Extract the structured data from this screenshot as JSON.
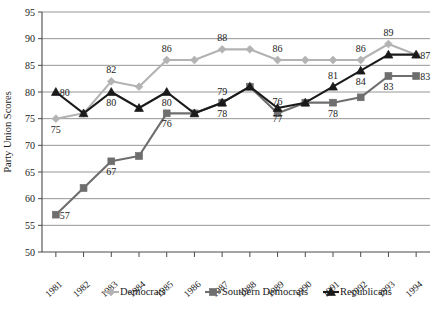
{
  "chart_data": {
    "type": "line",
    "title": "",
    "xlabel": "",
    "ylabel": "Party Union Scores",
    "categories": [
      "1981",
      "1982",
      "1983",
      "1984",
      "1985",
      "1986",
      "1987",
      "1988",
      "1989",
      "1990",
      "1991",
      "1992",
      "1993",
      "1994"
    ],
    "ylim": [
      50,
      95
    ],
    "ytick_step": 5,
    "yticks": [
      "50",
      "55",
      "60",
      "65",
      "70",
      "75",
      "80",
      "85",
      "90",
      "95"
    ],
    "grid": true,
    "legend_position": "bottom",
    "series": [
      {
        "name": "Democrats",
        "color": "#b3b3b3",
        "marker": "diamond",
        "values": [
          75,
          76,
          82,
          81,
          86,
          86,
          88,
          88,
          86,
          86,
          86,
          86,
          89,
          87
        ],
        "labels": [
          {
            "x": "1981",
            "value": 75,
            "text": "75",
            "pos": "below"
          },
          {
            "x": "1983",
            "value": 82,
            "text": "82",
            "pos": "above"
          },
          {
            "x": "1985",
            "value": 86,
            "text": "86",
            "pos": "above"
          },
          {
            "x": "1987",
            "value": 88,
            "text": "88",
            "pos": "above"
          },
          {
            "x": "1989",
            "value": 86,
            "text": "86",
            "pos": "above"
          },
          {
            "x": "1992",
            "value": 86,
            "text": "86",
            "pos": "above"
          },
          {
            "x": "1993",
            "value": 89,
            "text": "89",
            "pos": "above"
          }
        ]
      },
      {
        "name": "Southern Democrats",
        "color": "#6e6e6e",
        "marker": "square",
        "values": [
          57,
          62,
          67,
          68,
          76,
          76,
          78,
          81,
          76,
          78,
          78,
          79,
          83,
          83
        ],
        "labels": [
          {
            "x": "1981",
            "value": 57,
            "text": "57",
            "pos": "right"
          },
          {
            "x": "1983",
            "value": 67,
            "text": "67",
            "pos": "below"
          },
          {
            "x": "1985",
            "value": 76,
            "text": "76",
            "pos": "below"
          },
          {
            "x": "1987",
            "value": 78,
            "text": "78",
            "pos": "below"
          },
          {
            "x": "1989",
            "value": 76,
            "text": "76",
            "pos": "above"
          },
          {
            "x": "1991",
            "value": 78,
            "text": "78",
            "pos": "below"
          },
          {
            "x": "1993",
            "value": 83,
            "text": "83",
            "pos": "below"
          },
          {
            "x": "1994",
            "value": 83,
            "text": "83",
            "pos": "right"
          }
        ]
      },
      {
        "name": "Republicans",
        "color": "#1a1a1a",
        "marker": "triangle",
        "values": [
          80,
          76,
          80,
          77,
          80,
          76,
          78,
          81,
          77,
          78,
          81,
          84,
          87,
          87
        ],
        "labels": [
          {
            "x": "1981",
            "value": 80,
            "text": "80",
            "pos": "right"
          },
          {
            "x": "1983",
            "value": 80,
            "text": "80",
            "pos": "below"
          },
          {
            "x": "1985",
            "value": 80,
            "text": "80",
            "pos": "below"
          },
          {
            "x": "1987",
            "value": 78,
            "text": "79",
            "pos": "above"
          },
          {
            "x": "1989",
            "value": 77,
            "text": "77",
            "pos": "below"
          },
          {
            "x": "1991",
            "value": 81,
            "text": "81",
            "pos": "above"
          },
          {
            "x": "1992",
            "value": 84,
            "text": "84",
            "pos": "below"
          },
          {
            "x": "1994",
            "value": 87,
            "text": "87",
            "pos": "right"
          }
        ]
      }
    ]
  },
  "legend": {
    "items": [
      {
        "label": "Democrats"
      },
      {
        "label": "Southern Democrats"
      },
      {
        "label": "Republicans"
      }
    ]
  },
  "caption": {
    "text": ""
  }
}
